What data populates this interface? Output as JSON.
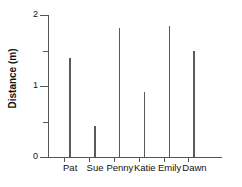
{
  "chart_data": {
    "type": "bar",
    "title": "",
    "subtitle": "",
    "xlabel": "",
    "ylabel": "Distance (m)",
    "categories": [
      "Pat",
      "Sue",
      "Penny",
      "Katie",
      "Emily",
      "Dawn"
    ],
    "values": [
      1.4,
      0.43,
      1.82,
      0.92,
      1.84,
      1.5
    ],
    "series": [
      {
        "name": "Distance",
        "values": [
          1.4,
          0.43,
          1.82,
          0.92,
          1.84,
          1.5
        ]
      }
    ],
    "ylim": [
      0,
      2
    ],
    "xlim_categories": 6,
    "y_major_ticks": [
      0,
      1,
      2
    ],
    "y_major_tick_labels": [
      "0",
      "1",
      "2"
    ],
    "y_minor_ticks": [
      0.5,
      1.5
    ],
    "grid": false,
    "legend": false,
    "legend_position": "none",
    "bar_style": "thin-spike",
    "colors": {
      "bar": "#5a5a5a",
      "axis": "#555555",
      "text": "#111111",
      "background": "#ffffff"
    }
  },
  "axis": {
    "y_title": "Distance (m)"
  }
}
